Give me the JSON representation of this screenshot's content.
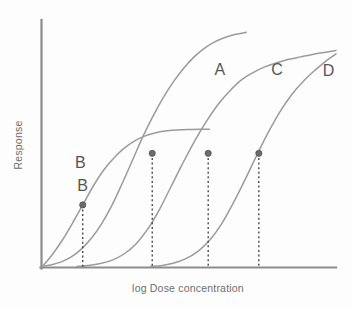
{
  "chart_data": {
    "type": "line",
    "title": "",
    "subtitle": "",
    "xlabel": "log Dose concentration",
    "ylabel": "Response",
    "grid": false,
    "legend": "inline-curve-labels",
    "axes": {
      "x_axis_label": "log Dose concentration",
      "y_axis_label": "Response",
      "x_ticks": [],
      "y_ticks": [],
      "xlim": [
        0,
        100
      ],
      "ylim": [
        0,
        100
      ],
      "axis_color": "#8c8c8c",
      "show_tick_labels": false
    },
    "curve_color": "#9b9b9b",
    "marker_color": "#6b6b6b",
    "dropline_color": "#3d3d3d",
    "series": [
      {
        "name": "A",
        "label": "A",
        "label_x": 60.6,
        "label_y": 78.5,
        "points": [
          [
            0.3,
            0.4
          ],
          [
            3.0,
            1.0
          ],
          [
            6.5,
            2.2
          ],
          [
            10.0,
            4.2
          ],
          [
            13.5,
            7.5
          ],
          [
            17.0,
            12.0
          ],
          [
            20.5,
            18.0
          ],
          [
            24.0,
            25.5
          ],
          [
            27.5,
            34.5
          ],
          [
            31.0,
            44.0
          ],
          [
            34.5,
            53.5
          ],
          [
            38.0,
            62.0
          ],
          [
            41.5,
            69.5
          ],
          [
            45.0,
            76.0
          ],
          [
            48.5,
            81.5
          ],
          [
            52.0,
            86.0
          ],
          [
            55.5,
            89.5
          ],
          [
            59.0,
            92.0
          ],
          [
            62.5,
            93.8
          ],
          [
            66.0,
            95.0
          ],
          [
            69.5,
            95.8
          ]
        ]
      },
      {
        "name": "B",
        "label": "B",
        "label_x": 13.2,
        "label_y": 40.5,
        "points": [
          [
            0.3,
            0.4
          ],
          [
            3.5,
            5.0
          ],
          [
            7.0,
            11.0
          ],
          [
            10.5,
            18.0
          ],
          [
            14.0,
            25.5
          ],
          [
            17.5,
            33.0
          ],
          [
            21.0,
            39.5
          ],
          [
            24.5,
            44.5
          ],
          [
            28.0,
            48.5
          ],
          [
            31.5,
            51.5
          ],
          [
            35.0,
            53.5
          ],
          [
            38.5,
            54.8
          ],
          [
            42.0,
            55.6
          ],
          [
            46.0,
            56.0
          ],
          [
            50.0,
            56.2
          ],
          [
            54.0,
            56.3
          ],
          [
            57.0,
            56.3
          ]
        ]
      },
      {
        "name": "C",
        "label": "C",
        "label_x": 80.0,
        "label_y": 78.5,
        "points": [
          [
            12.0,
            0.4
          ],
          [
            16.0,
            0.8
          ],
          [
            20.0,
            1.6
          ],
          [
            24.0,
            3.0
          ],
          [
            28.0,
            5.5
          ],
          [
            32.0,
            9.5
          ],
          [
            36.0,
            15.5
          ],
          [
            40.0,
            23.5
          ],
          [
            44.0,
            33.0
          ],
          [
            48.0,
            42.5
          ],
          [
            52.0,
            51.5
          ],
          [
            56.0,
            59.5
          ],
          [
            60.0,
            66.5
          ],
          [
            64.0,
            72.0
          ],
          [
            68.0,
            76.5
          ],
          [
            72.0,
            79.5
          ],
          [
            76.0,
            81.8
          ],
          [
            80.0,
            83.4
          ],
          [
            84.0,
            84.8
          ],
          [
            88.0,
            85.8
          ],
          [
            92.0,
            86.8
          ],
          [
            96.0,
            87.6
          ],
          [
            100.0,
            88.4
          ]
        ]
      },
      {
        "name": "D",
        "label": "D",
        "label_x": 97.5,
        "label_y": 78.0,
        "points": [
          [
            37.0,
            0.4
          ],
          [
            41.0,
            0.8
          ],
          [
            45.0,
            1.8
          ],
          [
            49.0,
            3.6
          ],
          [
            53.0,
            6.5
          ],
          [
            57.0,
            11.0
          ],
          [
            61.0,
            17.5
          ],
          [
            65.0,
            26.0
          ],
          [
            69.0,
            35.5
          ],
          [
            73.0,
            45.5
          ],
          [
            77.0,
            55.0
          ],
          [
            81.0,
            63.5
          ],
          [
            85.0,
            70.5
          ],
          [
            89.0,
            76.0
          ],
          [
            93.0,
            80.5
          ],
          [
            97.0,
            84.5
          ],
          [
            100.0,
            87.0
          ]
        ]
      }
    ],
    "annotated_points": [
      {
        "id": "B",
        "label": "B",
        "x": 14.0,
        "y": 25.5,
        "has_drop_line": true,
        "label_offset_y": -14
      },
      {
        "id": "ec50-a",
        "label": "",
        "x": 37.6,
        "y": 46.5,
        "has_drop_line": true
      },
      {
        "id": "ec50-b",
        "label": "",
        "x": 56.6,
        "y": 46.5,
        "has_drop_line": true
      },
      {
        "id": "ec50-c",
        "label": "",
        "x": 73.8,
        "y": 46.5,
        "has_drop_line": true
      }
    ]
  }
}
